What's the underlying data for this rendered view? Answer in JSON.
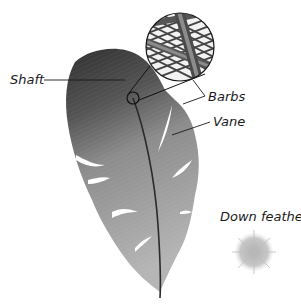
{
  "diagram": {
    "labels": {
      "shaft": "Shaft",
      "barbs": "Barbs",
      "vane": "Vane",
      "down_feather": "Down feather"
    },
    "colors": {
      "feather_dark": "#3a3a3a",
      "feather_light": "#b8b8b8",
      "shaft_line": "#2a2a2a",
      "down_feather": "#c4c4c4",
      "leader_line": "#1a1a1a",
      "background": "#ffffff"
    },
    "elements": [
      {
        "id": "contour-feather",
        "label": "Shaft",
        "type": "illustration"
      },
      {
        "id": "magnifier-inset",
        "label": "Barbs",
        "type": "magnified-detail"
      },
      {
        "id": "down-feather",
        "label": "Down feather",
        "type": "illustration"
      }
    ]
  }
}
